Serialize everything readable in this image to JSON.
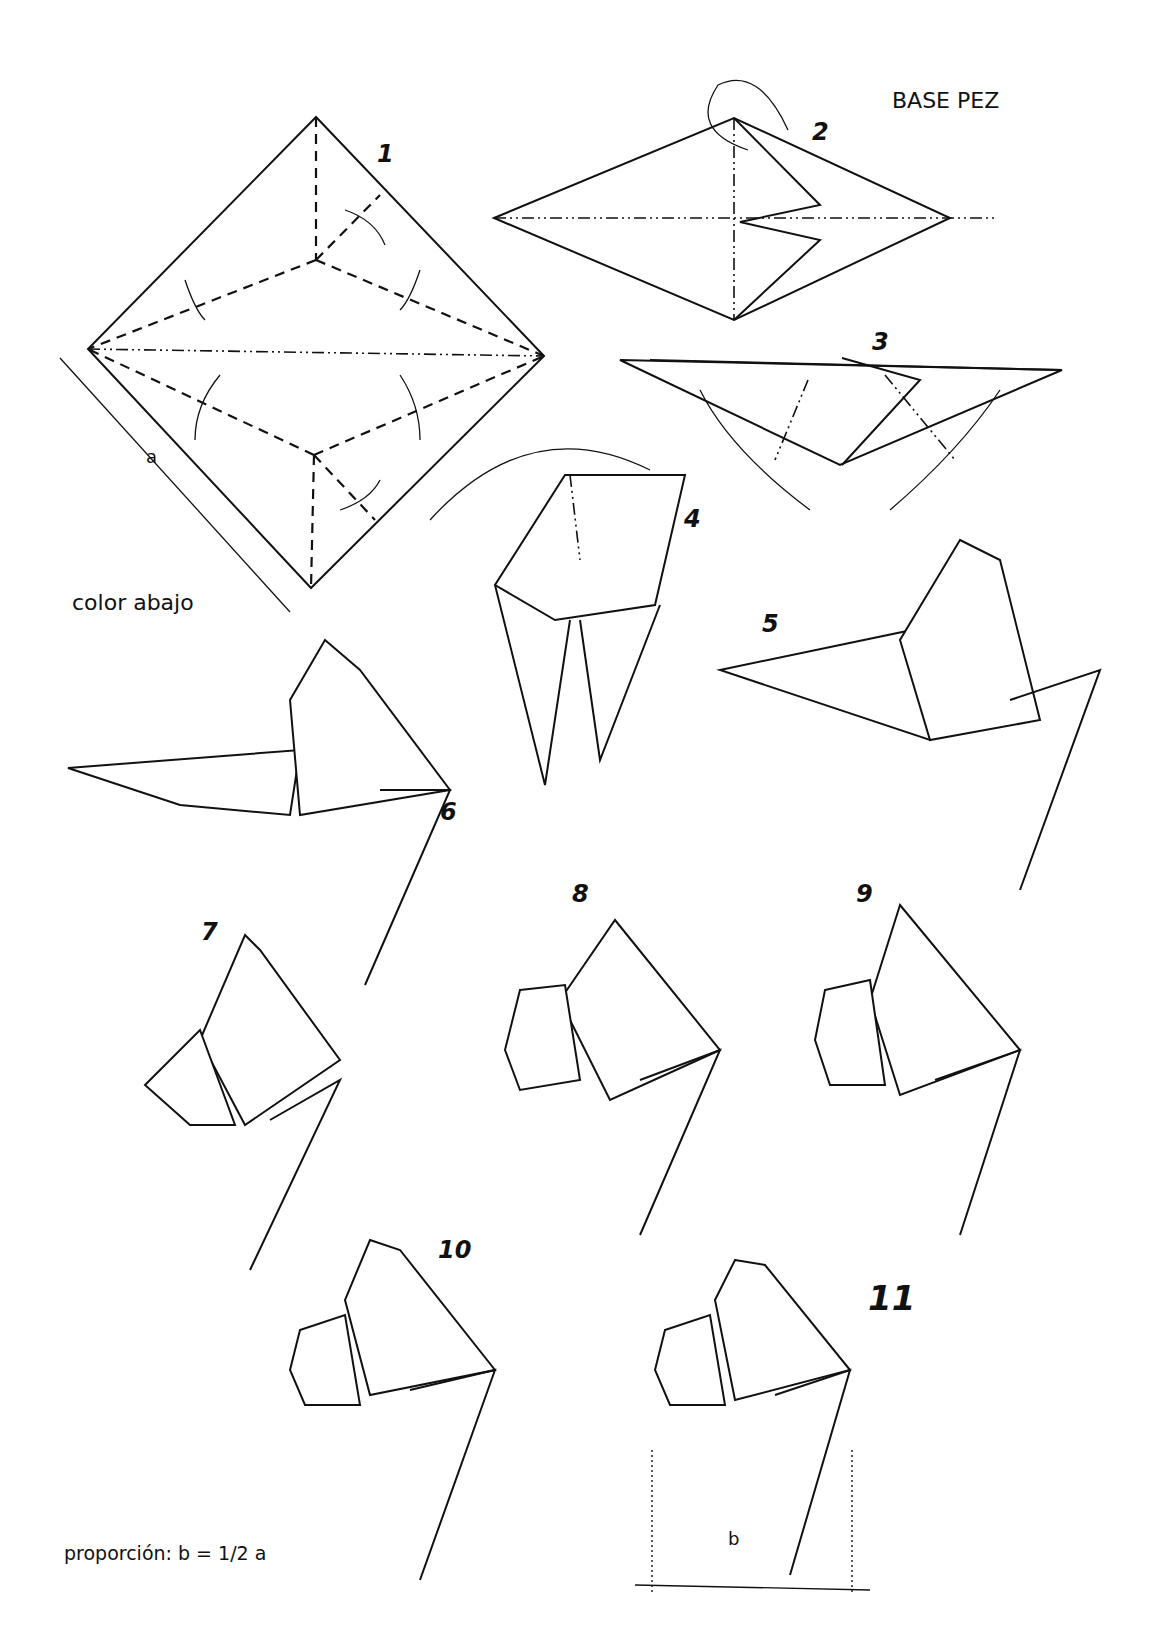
{
  "title": "BASE PEZ",
  "note_color": "color abajo",
  "proportion": "proporción: b = 1/2 a",
  "dimension_labels": {
    "a": "a",
    "b": "b"
  },
  "steps": [
    "1",
    "2",
    "3",
    "4",
    "5",
    "6",
    "7",
    "8",
    "9",
    "10",
    "11"
  ]
}
